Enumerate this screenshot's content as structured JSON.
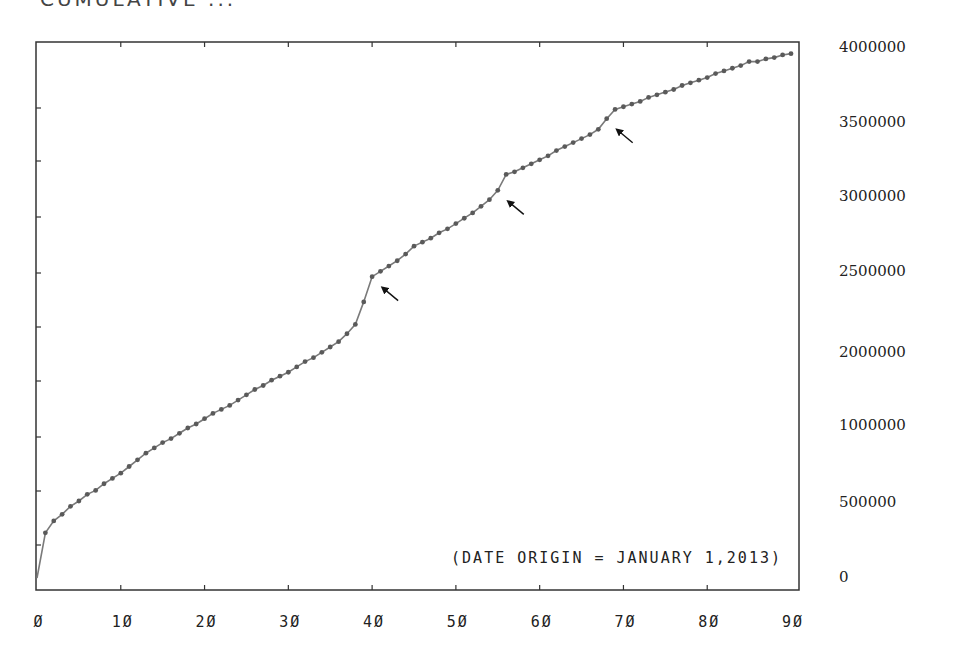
{
  "header": {
    "title": "CUMULATIVE ..."
  },
  "annotation": "(DATE ORIGIN = JANUARY 1,2013)",
  "colors": {
    "line": "#7a7a7a",
    "marker": "#5a5a5a",
    "frame": "#333333",
    "arrow": "#111111"
  },
  "chart_data": {
    "type": "line",
    "xlabel": "",
    "ylabel": "",
    "x_tick_labels": [
      "0",
      "10",
      "20",
      "30",
      "40",
      "50",
      "60",
      "70",
      "80",
      "90"
    ],
    "y_tick_labels": [
      "4000000",
      "3500000",
      "3000000",
      "2500000",
      "2000000",
      "1000000",
      "500000",
      "0"
    ],
    "xlim": [
      0,
      90
    ],
    "ylim": [
      0,
      4000000
    ],
    "grid": false,
    "legend": null,
    "annotations": [
      {
        "text": "(DATE ORIGIN = JANUARY 1,2013)",
        "position": "bottom-right"
      },
      {
        "type": "arrow",
        "points_to_x": 40
      },
      {
        "type": "arrow",
        "points_to_x": 55
      },
      {
        "type": "arrow",
        "points_to_x": 68
      }
    ],
    "series": [
      {
        "name": "cumulative",
        "x": [
          0,
          1,
          2,
          3,
          4,
          5,
          6,
          7,
          8,
          9,
          10,
          11,
          12,
          13,
          14,
          15,
          16,
          17,
          18,
          19,
          20,
          21,
          22,
          23,
          24,
          25,
          26,
          27,
          28,
          29,
          30,
          31,
          32,
          33,
          34,
          35,
          36,
          37,
          38,
          39,
          40,
          41,
          42,
          43,
          44,
          45,
          46,
          47,
          48,
          49,
          50,
          51,
          52,
          53,
          54,
          55,
          56,
          57,
          58,
          59,
          60,
          61,
          62,
          63,
          64,
          65,
          66,
          67,
          68,
          69,
          70,
          71,
          72,
          73,
          74,
          75,
          76,
          77,
          78,
          79,
          80,
          81,
          82,
          83,
          84,
          85,
          86,
          87,
          88,
          89,
          90
        ],
        "values": [
          0,
          340000,
          430000,
          480000,
          540000,
          580000,
          630000,
          660000,
          710000,
          750000,
          790000,
          840000,
          890000,
          940000,
          980000,
          1020000,
          1050000,
          1090000,
          1130000,
          1160000,
          1200000,
          1240000,
          1270000,
          1300000,
          1340000,
          1380000,
          1420000,
          1450000,
          1490000,
          1520000,
          1550000,
          1590000,
          1630000,
          1660000,
          1700000,
          1740000,
          1780000,
          1840000,
          1910000,
          2080000,
          2270000,
          2310000,
          2350000,
          2390000,
          2440000,
          2500000,
          2530000,
          2560000,
          2600000,
          2630000,
          2670000,
          2710000,
          2750000,
          2800000,
          2850000,
          2920000,
          3040000,
          3060000,
          3090000,
          3120000,
          3150000,
          3180000,
          3220000,
          3250000,
          3280000,
          3310000,
          3340000,
          3380000,
          3460000,
          3530000,
          3550000,
          3570000,
          3590000,
          3620000,
          3640000,
          3660000,
          3680000,
          3710000,
          3730000,
          3750000,
          3770000,
          3800000,
          3820000,
          3840000,
          3860000,
          3890000,
          3890000,
          3910000,
          3920000,
          3940000,
          3950000
        ]
      }
    ]
  }
}
